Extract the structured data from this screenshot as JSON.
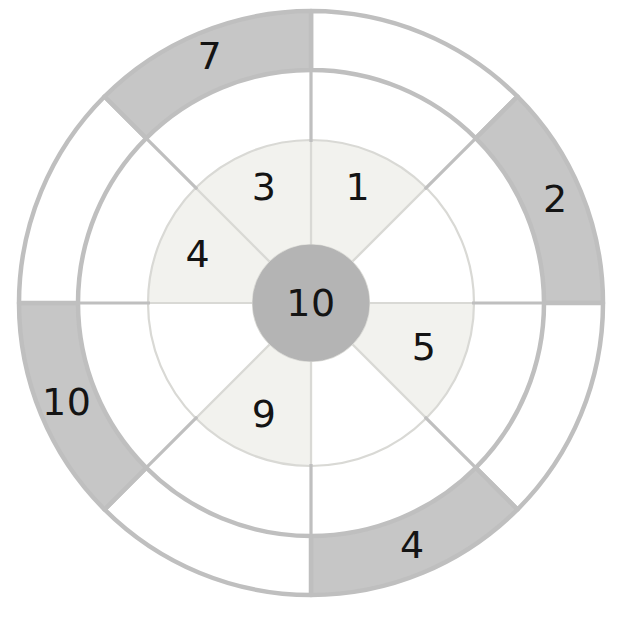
{
  "diagram": {
    "type": "wheel",
    "geometry": {
      "center_x": 311,
      "center_y": 303,
      "outer_radius": 292,
      "outer_ring_inner_radius": 233,
      "mid_radius": 163,
      "hub_radius": 58,
      "sector_count": 8,
      "sector_angle_deg": 45
    },
    "colors": {
      "shaded_gray": "#c6c6c6",
      "outer_rim_stroke": "#bfbfbf",
      "inner_ring_fill": "#f2f2ee",
      "inner_ring_stroke": "#d9d9d5",
      "hub_fill": "#b4b4b4",
      "unshaded_white": "#ffffff",
      "text": "#141414",
      "background": "#ffffff"
    },
    "hub": {
      "label": "10",
      "shaded": true
    },
    "inner_ring": [
      {
        "index": 0,
        "start_deg": -90,
        "end_deg": -45,
        "label": "1",
        "shaded": true,
        "position": "top-right"
      },
      {
        "index": 1,
        "start_deg": -45,
        "end_deg": 0,
        "label": "",
        "shaded": false,
        "position": "right-upper"
      },
      {
        "index": 2,
        "start_deg": 0,
        "end_deg": 45,
        "label": "5",
        "shaded": true,
        "position": "right-lower"
      },
      {
        "index": 3,
        "start_deg": 45,
        "end_deg": 90,
        "label": "",
        "shaded": false,
        "position": "bottom-right"
      },
      {
        "index": 4,
        "start_deg": 90,
        "end_deg": 135,
        "label": "9",
        "shaded": true,
        "position": "bottom-left"
      },
      {
        "index": 5,
        "start_deg": 135,
        "end_deg": 180,
        "label": "",
        "shaded": false,
        "position": "left-lower"
      },
      {
        "index": 6,
        "start_deg": 180,
        "end_deg": 225,
        "label": "4",
        "shaded": true,
        "position": "left-upper"
      },
      {
        "index": 7,
        "start_deg": 225,
        "end_deg": 270,
        "label": "3",
        "shaded": true,
        "position": "top-left"
      }
    ],
    "outer_ring": [
      {
        "index": 0,
        "start_deg": -90,
        "end_deg": -45,
        "label": "",
        "shaded": false,
        "position": "top-right"
      },
      {
        "index": 1,
        "start_deg": -45,
        "end_deg": 0,
        "label": "2",
        "shaded": true,
        "position": "right-upper"
      },
      {
        "index": 2,
        "start_deg": 0,
        "end_deg": 45,
        "label": "",
        "shaded": false,
        "position": "right-lower"
      },
      {
        "index": 3,
        "start_deg": 45,
        "end_deg": 90,
        "label": "4",
        "shaded": true,
        "position": "bottom-right"
      },
      {
        "index": 4,
        "start_deg": 90,
        "end_deg": 135,
        "label": "",
        "shaded": false,
        "position": "bottom-left"
      },
      {
        "index": 5,
        "start_deg": 135,
        "end_deg": 180,
        "label": "10",
        "shaded": true,
        "position": "left-lower"
      },
      {
        "index": 6,
        "start_deg": 180,
        "end_deg": 225,
        "label": "",
        "shaded": false,
        "position": "left-upper"
      },
      {
        "index": 7,
        "start_deg": 225,
        "end_deg": 270,
        "label": "7",
        "shaded": true,
        "position": "top-left"
      }
    ]
  },
  "chart_data": {
    "type": "pie",
    "rings": [
      {
        "name": "hub",
        "inner_radius": 0,
        "outer_radius": 58,
        "slices": [
          {
            "label": "10",
            "angle_deg": 360,
            "shaded": true
          }
        ]
      },
      {
        "name": "inner_ring",
        "inner_radius": 58,
        "outer_radius": 163,
        "slices": [
          {
            "label": "1",
            "angle_deg": 45,
            "shaded": true
          },
          {
            "label": "",
            "angle_deg": 45,
            "shaded": false
          },
          {
            "label": "5",
            "angle_deg": 45,
            "shaded": true
          },
          {
            "label": "",
            "angle_deg": 45,
            "shaded": false
          },
          {
            "label": "9",
            "angle_deg": 45,
            "shaded": true
          },
          {
            "label": "",
            "angle_deg": 45,
            "shaded": false
          },
          {
            "label": "4",
            "angle_deg": 45,
            "shaded": true
          },
          {
            "label": "3",
            "angle_deg": 45,
            "shaded": true
          }
        ]
      },
      {
        "name": "outer_ring",
        "inner_radius": 233,
        "outer_radius": 292,
        "slices": [
          {
            "label": "",
            "angle_deg": 45,
            "shaded": false
          },
          {
            "label": "2",
            "angle_deg": 45,
            "shaded": true
          },
          {
            "label": "",
            "angle_deg": 45,
            "shaded": false
          },
          {
            "label": "4",
            "angle_deg": 45,
            "shaded": true
          },
          {
            "label": "",
            "angle_deg": 45,
            "shaded": false
          },
          {
            "label": "10",
            "angle_deg": 45,
            "shaded": true
          },
          {
            "label": "",
            "angle_deg": 45,
            "shaded": false
          },
          {
            "label": "7",
            "angle_deg": 45,
            "shaded": true
          }
        ]
      }
    ],
    "values": [
      10,
      1,
      5,
      9,
      4,
      3,
      2,
      4,
      10,
      7
    ],
    "categories": [
      "hub-10",
      "inner-1",
      "inner-5",
      "inner-9",
      "inner-4",
      "inner-3",
      "outer-2",
      "outer-4",
      "outer-10",
      "outer-7"
    ],
    "legend": [],
    "xlabel": "",
    "ylabel": "",
    "grid": false
  }
}
